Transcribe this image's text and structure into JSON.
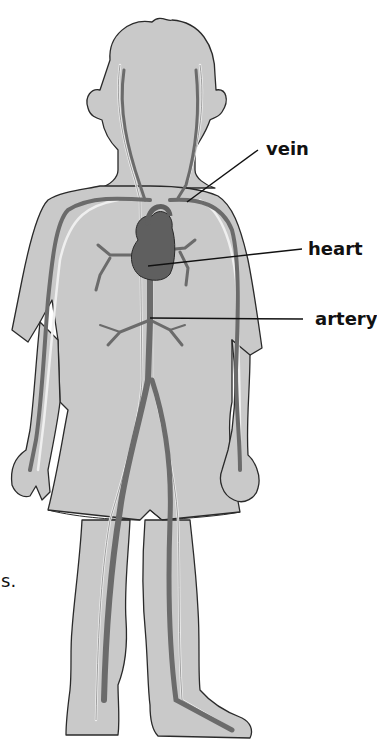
{
  "diagram": {
    "labels": [
      {
        "id": "vein",
        "text": "vein"
      },
      {
        "id": "heart",
        "text": "heart"
      },
      {
        "id": "artery",
        "text": "artery"
      }
    ],
    "stray_text": "s."
  },
  "colors": {
    "body_fill": "#c9c9c9",
    "outline": "#2a2a2a",
    "artery": "#6b6b6b",
    "vein_highlight": "#e6e6e6",
    "heart": "#5f5f5f"
  }
}
